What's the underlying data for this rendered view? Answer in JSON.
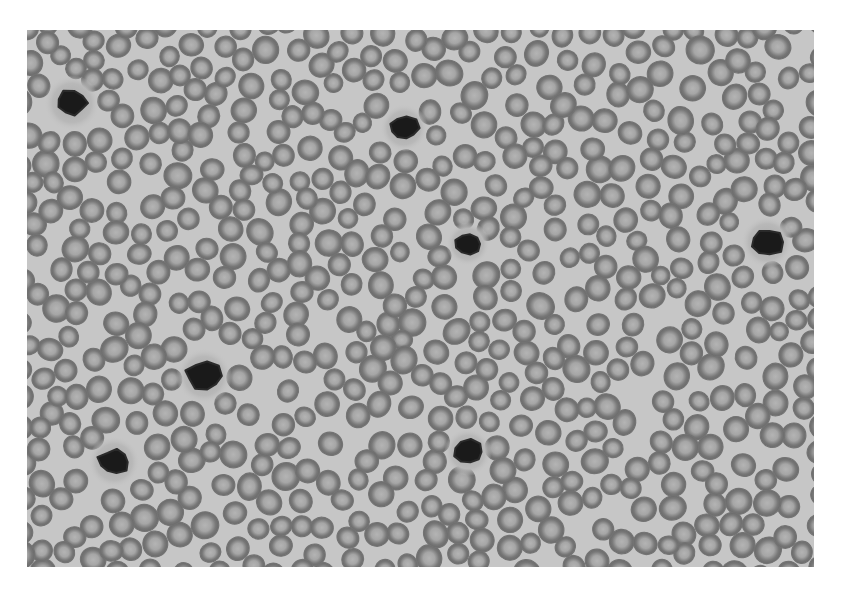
{
  "image": {
    "description": "Grayscale light micrograph of a peripheral blood smear: densely packed red blood cells with scattered dark-staining white blood cells",
    "frame": {
      "x": 27,
      "y": 30,
      "width": 787,
      "height": 537
    },
    "colors": {
      "page_background": "#ffffff",
      "smear_background": "#c6c6c6",
      "rbc_rim": "#6f6f6f",
      "rbc_center": "#a9a9a9",
      "wbc_nucleus": "#1a1a1a",
      "wbc_cytoplasm": "#b3b3b3"
    },
    "rbc": {
      "approx_count": 620,
      "radius_px": 11.5
    },
    "wbc": [
      {
        "label": "white-blood-cell-1",
        "cx": 72,
        "cy": 103,
        "r": 14,
        "cyto_r": 28
      },
      {
        "label": "white-blood-cell-2",
        "cx": 404,
        "cy": 128,
        "r": 14,
        "cyto_r": 24
      },
      {
        "label": "white-blood-cell-3",
        "cx": 468,
        "cy": 244,
        "r": 13,
        "cyto_r": 22
      },
      {
        "label": "white-blood-cell-4",
        "cx": 767,
        "cy": 242,
        "r": 15,
        "cyto_r": 26
      },
      {
        "label": "white-blood-cell-5",
        "cx": 204,
        "cy": 376,
        "r": 16,
        "cyto_r": 28
      },
      {
        "label": "white-blood-cell-6",
        "cx": 114,
        "cy": 462,
        "r": 14,
        "cyto_r": 26
      },
      {
        "label": "white-blood-cell-7",
        "cx": 468,
        "cy": 452,
        "r": 14,
        "cyto_r": 24
      }
    ]
  }
}
